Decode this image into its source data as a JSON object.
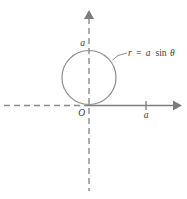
{
  "figure": {
    "type": "polar-curve-diagram",
    "background_color": "#ffffff",
    "stroke_color": "#6e6e6e",
    "text_color": "#3a3a3a",
    "curve": {
      "equation_label": "r = a sinθ",
      "equation_parts": {
        "r": "r",
        "equals": "=",
        "a": "a",
        "sin": "sin",
        "theta": "θ"
      },
      "shape": "circle",
      "center": [
        89,
        75
      ],
      "radius": 27,
      "tangent_point": "origin"
    },
    "origin_label": "O",
    "y_axis_tick_label": "a",
    "x_axis_tick_label": "a",
    "axes": {
      "horizontal": {
        "left_style": "dashed",
        "right_style": "solid",
        "arrow": "right"
      },
      "vertical": {
        "style": "dashed",
        "arrow": "up"
      }
    }
  }
}
